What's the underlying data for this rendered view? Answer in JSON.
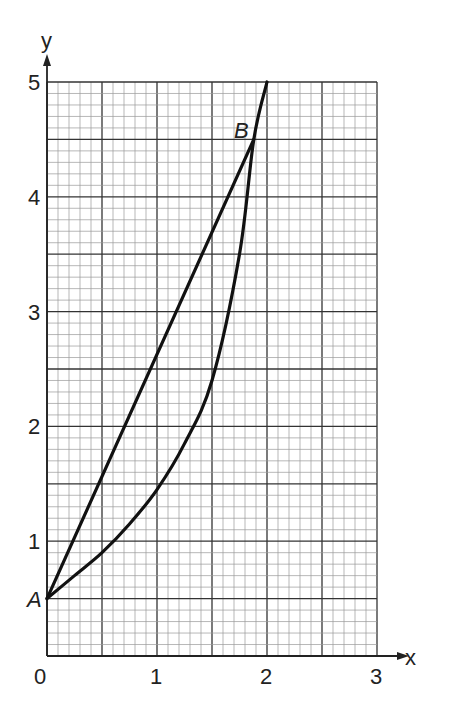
{
  "chart_data": {
    "type": "line",
    "title": "",
    "xlabel": "x",
    "ylabel": "y",
    "xlim": [
      0,
      3
    ],
    "ylim": [
      0,
      5
    ],
    "grid": true,
    "x_ticks": [
      "0",
      "1",
      "2",
      "3"
    ],
    "y_ticks": [
      "1",
      "2",
      "3",
      "4",
      "5"
    ],
    "points": [
      {
        "label": "A",
        "x": 0,
        "y": 0.5
      },
      {
        "label": "B",
        "x": 1.88,
        "y": 4.5
      }
    ],
    "series": [
      {
        "name": "line AB",
        "x": [
          0,
          1.88
        ],
        "y": [
          0.5,
          4.5
        ]
      },
      {
        "name": "curve",
        "x": [
          0,
          0.25,
          0.5,
          0.75,
          1.0,
          1.25,
          1.5,
          1.75,
          1.88,
          2.0
        ],
        "y": [
          0.5,
          0.7,
          0.9,
          1.15,
          1.45,
          1.85,
          2.4,
          3.5,
          4.5,
          5.0
        ]
      }
    ]
  },
  "labels": {
    "y_axis": "y",
    "x_axis": "x",
    "origin": "0",
    "point_a": "A",
    "point_b": "B",
    "x1": "1",
    "x2": "2",
    "x3": "3",
    "y1": "1",
    "y2": "2",
    "y3": "3",
    "y4": "4",
    "y5": "5"
  }
}
